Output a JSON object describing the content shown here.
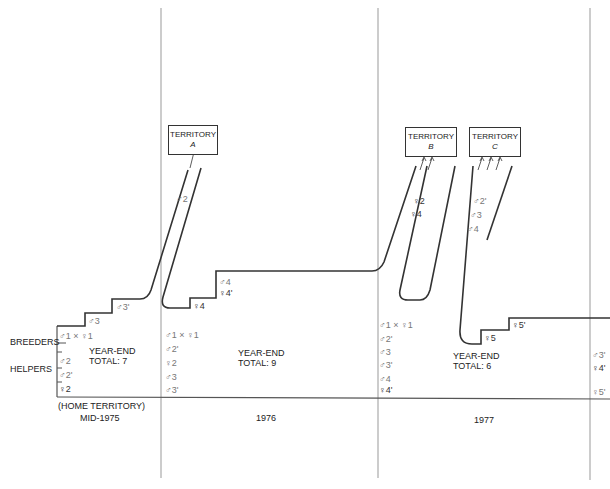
{
  "axis": {
    "breeders_label": "BREEDERS",
    "helpers_label": "HELPERS",
    "home_territory_label": "(HOME TERRITORY)",
    "periods": [
      "MID-1975",
      "1976",
      "1977"
    ]
  },
  "territories": [
    {
      "title": "TERRITORY",
      "letter": "A"
    },
    {
      "title": "TERRITORY",
      "letter": "B"
    },
    {
      "title": "TERRITORY",
      "letter": "C"
    }
  ],
  "year_end": [
    {
      "line1": "YEAR-END",
      "line2": "TOTAL: 7"
    },
    {
      "line1": "YEAR-END",
      "line2": "TOTAL: 9"
    },
    {
      "line1": "YEAR-END",
      "line2": "TOTAL: 6"
    }
  ],
  "roster_1975": [
    "♂1 × ♀1",
    "♂2",
    "♂2'",
    "♀2"
  ],
  "roster_1976": [
    "♂1 × ♀1",
    "♂2'",
    "♀2",
    "♂3",
    "♂3'"
  ],
  "roster_1977": [
    "♂1 × ♀1",
    "♂2'",
    "♂3",
    "♂3'",
    "♂4",
    "♀4'"
  ],
  "roster_end": [
    "♂3'",
    "♀4'",
    "♀5'"
  ],
  "step_labels": {
    "s1975_a": "♂3",
    "s1975_b": "♂3'",
    "s1976_a": "♀4",
    "s1976_b": "♂4",
    "s1976_c": "♀4'",
    "s1977_a": "♀5",
    "s1977_b": "♀5'"
  },
  "dispersal": {
    "to_A": [
      "♂2"
    ],
    "to_B": [
      "♀2",
      "♀4"
    ],
    "to_C": [
      "♂2'",
      "♂3",
      "♂4"
    ]
  }
}
